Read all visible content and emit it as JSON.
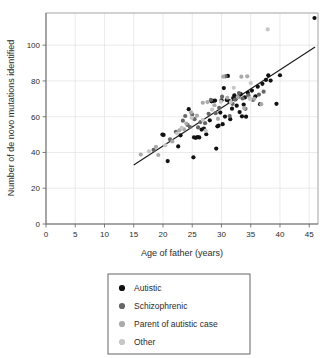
{
  "chart_data": {
    "type": "scatter",
    "title": "",
    "xlabel": "Age of father (years)",
    "ylabel": "Number of de novo mutations identified",
    "xlim": [
      0,
      46.5
    ],
    "ylim": [
      0,
      118
    ],
    "xticks": [
      0,
      5,
      10,
      15,
      20,
      25,
      30,
      35,
      40,
      45
    ],
    "yticks": [
      0,
      20,
      40,
      60,
      80,
      100
    ],
    "grid": true,
    "legend_position": "below-plot",
    "trendline": {
      "label": "linear fit",
      "x": [
        15,
        46
      ],
      "y": [
        33,
        99
      ],
      "color": "#1a1a1a"
    },
    "series": [
      {
        "name": "Autistic",
        "color": "#111111",
        "points": [
          [
            20.8,
            35.2
          ],
          [
            22.6,
            43.4
          ],
          [
            24.4,
            64.2
          ],
          [
            25.2,
            37.3
          ],
          [
            25.3,
            48.5
          ],
          [
            25.6,
            48.2
          ],
          [
            25.9,
            48.6
          ],
          [
            26.2,
            48.4
          ],
          [
            26.6,
            52.8
          ],
          [
            27.0,
            53.4
          ],
          [
            27.4,
            50.2
          ],
          [
            28.0,
            58.0
          ],
          [
            28.3,
            68.6
          ],
          [
            28.6,
            68.9
          ],
          [
            28.9,
            69.0
          ],
          [
            29.1,
            42.2
          ],
          [
            29.3,
            54.6
          ],
          [
            29.5,
            55.0
          ],
          [
            29.8,
            62.3
          ],
          [
            30.0,
            69.2
          ],
          [
            30.2,
            55.8
          ],
          [
            30.4,
            76.0
          ],
          [
            30.6,
            60.1
          ],
          [
            30.9,
            69.4
          ],
          [
            31.1,
            82.8
          ],
          [
            31.3,
            68.8
          ],
          [
            31.5,
            58.6
          ],
          [
            31.8,
            64.5
          ],
          [
            32.0,
            70.4
          ],
          [
            32.2,
            72.0
          ],
          [
            32.4,
            69.8
          ],
          [
            32.6,
            66.2
          ],
          [
            32.9,
            71.2
          ],
          [
            33.1,
            62.6
          ],
          [
            33.3,
            72.6
          ],
          [
            33.5,
            60.2
          ],
          [
            33.8,
            66.8
          ],
          [
            34.0,
            70.8
          ],
          [
            34.2,
            60.0
          ],
          [
            34.5,
            73.4
          ],
          [
            35.2,
            74.6
          ],
          [
            35.8,
            71.4
          ],
          [
            36.2,
            76.8
          ],
          [
            36.6,
            67.0
          ],
          [
            37.0,
            78.4
          ],
          [
            37.6,
            80.6
          ],
          [
            38.0,
            83.2
          ],
          [
            38.4,
            80.2
          ],
          [
            39.4,
            67.2
          ],
          [
            40.0,
            83.2
          ],
          [
            45.9,
            115.2
          ],
          [
            19.9,
            50.0
          ],
          [
            23.0,
            49.6
          ],
          [
            20.1,
            49.8
          ]
        ]
      },
      {
        "name": "Schizophrenic",
        "color": "#666666",
        "points": [
          [
            18.4,
            41.4
          ],
          [
            21.2,
            47.4
          ],
          [
            23.4,
            57.8
          ],
          [
            23.8,
            60.4
          ],
          [
            24.2,
            55.4
          ],
          [
            24.6,
            54.2
          ],
          [
            25.0,
            61.2
          ],
          [
            25.4,
            58.6
          ],
          [
            26.0,
            54.0
          ],
          [
            26.4,
            57.0
          ],
          [
            27.2,
            56.4
          ],
          [
            27.8,
            61.6
          ],
          [
            28.2,
            69.4
          ],
          [
            29.0,
            62.0
          ],
          [
            29.6,
            65.0
          ],
          [
            30.1,
            71.2
          ],
          [
            30.7,
            82.6
          ],
          [
            31.4,
            60.4
          ],
          [
            31.9,
            67.2
          ],
          [
            32.3,
            69.6
          ],
          [
            33.0,
            73.2
          ],
          [
            33.6,
            70.2
          ],
          [
            34.1,
            64.4
          ],
          [
            34.6,
            72.0
          ],
          [
            35.4,
            69.4
          ],
          [
            36.4,
            72.4
          ],
          [
            37.2,
            74.0
          ],
          [
            22.2,
            51.6
          ]
        ]
      },
      {
        "name": "Parent of autistic case",
        "color": "#aaaaaa",
        "points": [
          [
            16.2,
            38.8
          ],
          [
            19.2,
            38.6
          ],
          [
            21.6,
            46.2
          ],
          [
            22.8,
            52.4
          ],
          [
            23.6,
            53.0
          ],
          [
            24.0,
            56.2
          ],
          [
            24.8,
            62.4
          ],
          [
            25.8,
            60.6
          ],
          [
            26.8,
            67.8
          ],
          [
            27.6,
            68.2
          ],
          [
            28.8,
            66.4
          ],
          [
            30.3,
            82.4
          ],
          [
            31.0,
            70.6
          ],
          [
            32.8,
            71.0
          ],
          [
            33.4,
            82.4
          ],
          [
            34.4,
            82.6
          ],
          [
            34.8,
            70.4
          ],
          [
            35.6,
            70.0
          ],
          [
            36.8,
            67.0
          ],
          [
            18.8,
            43.2
          ],
          [
            29.4,
            58.8
          ],
          [
            33.9,
            64.8
          ]
        ]
      },
      {
        "name": "Other",
        "color": "#c6c6c6",
        "points": [
          [
            17.6,
            40.6
          ],
          [
            20.4,
            44.0
          ],
          [
            22.4,
            50.6
          ],
          [
            23.2,
            53.8
          ],
          [
            26.8,
            58.2
          ],
          [
            28.4,
            64.0
          ],
          [
            29.9,
            68.4
          ],
          [
            31.6,
            68.2
          ],
          [
            34.9,
            69.8
          ],
          [
            35.0,
            78.8
          ],
          [
            37.9,
            108.8
          ],
          [
            32.1,
            76.2
          ],
          [
            24.9,
            59.4
          ],
          [
            27.3,
            52.2
          ]
        ]
      }
    ]
  },
  "legend": {
    "items": [
      {
        "label": "Autistic",
        "color": "#111111"
      },
      {
        "label": "Schizophrenic",
        "color": "#666666"
      },
      {
        "label": "Parent of autistic case",
        "color": "#aaaaaa"
      },
      {
        "label": "Other",
        "color": "#c6c6c6"
      }
    ]
  }
}
